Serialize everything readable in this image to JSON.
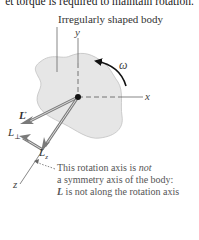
{
  "header": {
    "cut_text": "et torque is required to maintain rotation."
  },
  "diagram": {
    "title": "Irregularly shaped body",
    "axes": {
      "x": "x",
      "y": "y",
      "z": "z"
    },
    "angular_velocity": "ω",
    "vectors": {
      "L": "L",
      "L_perp": "L",
      "L_perp_sub": "⊥",
      "L_z": "L",
      "L_z_sub": "z"
    },
    "caption": {
      "line1_pre": "This rotation axis is ",
      "line1_em": "not",
      "line2": "a symmetry axis of the body:",
      "line3_vec": "L",
      "line3_rest": " is not along the rotation axis"
    },
    "colors": {
      "body_fill": "#e6e6e6",
      "body_stroke": "#bdbdbd",
      "vector": "#8a8a8a",
      "axis": "#555555"
    }
  }
}
